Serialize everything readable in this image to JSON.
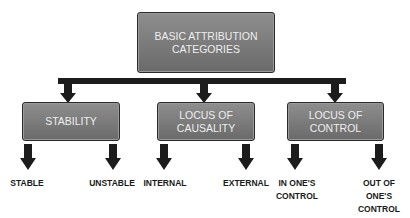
{
  "diagram": {
    "root": {
      "label": "BASIC ATTRIBUTION\nCATEGORIES"
    },
    "categories": [
      {
        "label": "STABILITY",
        "children": [
          "STABLE",
          "UNSTABLE"
        ]
      },
      {
        "label": "LOCUS OF\nCAUSALITY",
        "children": [
          "INTERNAL",
          "EXTERNAL"
        ]
      },
      {
        "label": "LOCUS OF\nCONTROL",
        "children": [
          "IN ONE'S\nCONTROL",
          "OUT OF\nONE'S\nCONTROL"
        ]
      }
    ]
  },
  "colors": {
    "box_fill": "#7a7a7a",
    "box_text": "#eeeeee",
    "connector": "#1c1c1c",
    "leaf_text": "#1a1a1a"
  }
}
